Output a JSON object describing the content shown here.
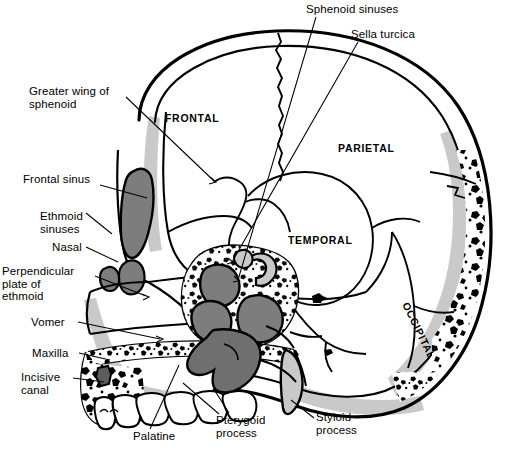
{
  "figure": {
    "colors": {
      "outline": "#000000",
      "sinus_fill": "#7d7d7d",
      "shadow_gray": "#c9c9c9",
      "mid_gray": "#a8a8a8",
      "background": "#ffffff"
    }
  },
  "bone_labels": [
    {
      "id": "frontal",
      "text": "FRONTAL",
      "x": 165,
      "y": 112,
      "rotated": false
    },
    {
      "id": "parietal",
      "text": "PARIETAL",
      "x": 338,
      "y": 142,
      "rotated": false
    },
    {
      "id": "temporal",
      "text": "TEMPORAL",
      "x": 288,
      "y": 234,
      "rotated": false
    },
    {
      "id": "occipital",
      "text": "OCCIPITAL",
      "x": 411,
      "y": 305,
      "rotated": true
    }
  ],
  "callouts": [
    {
      "id": "greater-wing-of-sphenoid",
      "text": "Greater wing of\nsphenoid",
      "x": 29,
      "y": 85,
      "align": "left"
    },
    {
      "id": "frontal-sinus",
      "text": "Frontal sinus",
      "x": 23,
      "y": 173,
      "align": "left"
    },
    {
      "id": "ethmoid-sinuses",
      "text": "Ethmoid\nsinuses",
      "x": 40,
      "y": 210,
      "align": "left"
    },
    {
      "id": "nasal",
      "text": "Nasal",
      "x": 52,
      "y": 244,
      "align": "left"
    },
    {
      "id": "perpendicular-plate-of-ethmoid",
      "text": "Perpendicular\nplate of\nethmoid",
      "x": 2,
      "y": 265,
      "align": "left"
    },
    {
      "id": "vomer",
      "text": "Vomer",
      "x": 31,
      "y": 320,
      "align": "left"
    },
    {
      "id": "maxilla",
      "text": "Maxilla",
      "x": 32,
      "y": 350,
      "align": "left"
    },
    {
      "id": "incisive-canal",
      "text": "Incisive\ncanal",
      "x": 21,
      "y": 370,
      "align": "left"
    },
    {
      "id": "palatine",
      "text": "Palatine",
      "x": 133,
      "y": 432,
      "align": "left"
    },
    {
      "id": "pterygoid-process",
      "text": "Pterygoid\nprocess",
      "x": 216,
      "y": 418,
      "align": "left"
    },
    {
      "id": "styloid-process",
      "text": "Styloid\nprocess",
      "x": 316,
      "y": 415,
      "align": "left"
    },
    {
      "id": "sphenoid-sinuses",
      "text": "Sphenoid sinuses",
      "x": 306,
      "y": 3,
      "align": "left"
    },
    {
      "id": "sella-turcica",
      "text": "Sella turcica",
      "x": 351,
      "y": 29,
      "align": "left"
    }
  ],
  "leader_lines": [
    {
      "id": "leader-greater-wing-of-sphenoid",
      "from": [
        126,
        97
      ],
      "to": [
        214,
        181
      ]
    },
    {
      "id": "leader-frontal-sinus",
      "from": [
        100,
        185
      ],
      "to": [
        147,
        198
      ]
    },
    {
      "id": "leader-ethmoid-sinuses",
      "from": [
        86,
        213
      ],
      "to": [
        112,
        234
      ]
    },
    {
      "id": "leader-nasal",
      "from": [
        86,
        247
      ],
      "to": [
        114,
        261
      ]
    },
    {
      "id": "leader-perpendicular-plate",
      "from": [
        93,
        276
      ],
      "to": [
        144,
        295
      ]
    },
    {
      "id": "leader-vomer",
      "from": [
        78,
        322
      ],
      "to": [
        158,
        339
      ]
    },
    {
      "id": "leader-maxilla",
      "from": [
        79,
        353
      ],
      "to": [
        108,
        360
      ]
    },
    {
      "id": "leader-incisive-canal",
      "from": [
        73,
        378
      ],
      "to": [
        103,
        382
      ]
    },
    {
      "id": "leader-palatine",
      "from": [
        150,
        429
      ],
      "to": [
        178,
        366
      ]
    },
    {
      "id": "leader-pterygoid-process-a",
      "from": [
        219,
        415
      ],
      "to": [
        182,
        383
      ]
    },
    {
      "id": "leader-pterygoid-process-b",
      "from": [
        228,
        414
      ],
      "to": [
        214,
        392
      ]
    },
    {
      "id": "leader-styloid-process",
      "from": [
        314,
        418
      ],
      "to": [
        290,
        401
      ]
    },
    {
      "id": "leader-sphenoid-sinuses",
      "from": [
        316,
        16
      ],
      "to": [
        237,
        278
      ]
    },
    {
      "id": "leader-sella-turcica",
      "from": [
        358,
        41
      ],
      "to": [
        231,
        261
      ]
    }
  ],
  "caption": {
    "frontal_bold": true
  }
}
